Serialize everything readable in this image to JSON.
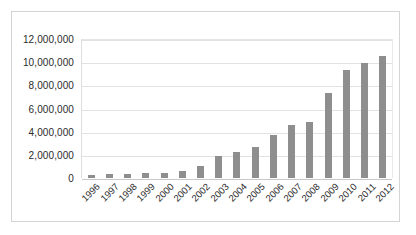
{
  "chart_data": {
    "type": "bar",
    "title": "",
    "subtitle": "",
    "xlabel": "",
    "ylabel": "",
    "categories": [
      "1996",
      "1997",
      "1998",
      "1999",
      "2000",
      "2001",
      "2002",
      "2003",
      "2004",
      "2005",
      "2006",
      "2007",
      "2008",
      "2009",
      "2010",
      "2011",
      "2012"
    ],
    "values": [
      250000,
      350000,
      370000,
      400000,
      450000,
      600000,
      1000000,
      1900000,
      2250000,
      2700000,
      3700000,
      4600000,
      4850000,
      7350000,
      9350000,
      9950000,
      10550000
    ],
    "series": [
      {
        "name": "",
        "values": [
          250000,
          350000,
          370000,
          400000,
          450000,
          600000,
          1000000,
          1900000,
          2250000,
          2700000,
          3700000,
          4600000,
          4850000,
          7350000,
          9350000,
          9950000,
          10550000
        ]
      }
    ],
    "ylim": [
      0,
      12000000
    ],
    "ytick_values": [
      0,
      2000000,
      4000000,
      6000000,
      8000000,
      10000000,
      12000000
    ],
    "ytick_labels": [
      "0",
      "2,000,000",
      "4,000,000",
      "6,000,000",
      "8,000,000",
      "10,000,000",
      "12,000,000"
    ],
    "grid": true,
    "grid_axis": "y",
    "legend": false,
    "legend_position": "none",
    "annotations": [],
    "colors": {
      "bar": "#8e8e8e",
      "gridline": "#e2e2e0",
      "axis": "#c8c8c6",
      "border": "#d4d4d4",
      "background": "#ffffff",
      "text": "#2b2b2b"
    }
  }
}
